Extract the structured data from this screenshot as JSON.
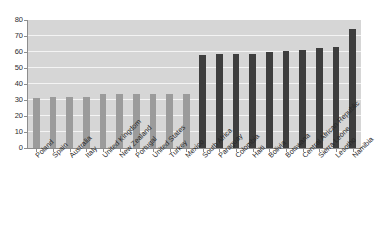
{
  "chart_data": {
    "type": "bar",
    "title": "",
    "xlabel": "",
    "ylabel": "",
    "ylim": [
      0,
      80
    ],
    "yticks": [
      0,
      10,
      20,
      30,
      40,
      50,
      60,
      70,
      80
    ],
    "grid": true,
    "legend": "none",
    "categories": [
      "Poland",
      "Spain",
      "Australia",
      "Italy",
      "United Kingdom",
      "New Zealand",
      "Portugal",
      "United States",
      "Turkey",
      "Mexico",
      "South Africa",
      "Paraguay",
      "Colombia",
      "Haiti",
      "Bolivia",
      "Botswana",
      "Central African Republic",
      "Sierra Leone",
      "Lesotho",
      "Namibia"
    ],
    "values": [
      31.5,
      32,
      32,
      32,
      33.5,
      33.5,
      33.5,
      33.5,
      34,
      34,
      58,
      58.5,
      59,
      59,
      60,
      60.5,
      61,
      62.5,
      63,
      74.5
    ],
    "bar_colors": [
      "light",
      "light",
      "light",
      "light",
      "light",
      "light",
      "light",
      "light",
      "light",
      "light",
      "dark",
      "dark",
      "dark",
      "dark",
      "dark",
      "dark",
      "dark",
      "dark",
      "dark",
      "dark"
    ],
    "colors": {
      "light_bar": "#9b9b9b",
      "dark_bar": "#3e3e3e",
      "plot_background": "#d6d6d6",
      "gridline": "#f4f4f4",
      "axis": "#8d8d8d",
      "page_background": "#ffffff",
      "text": "#262626"
    }
  }
}
